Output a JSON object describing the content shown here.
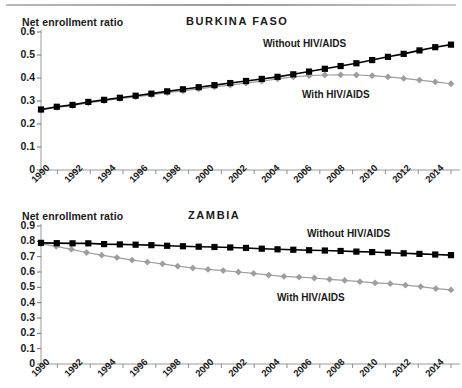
{
  "figure": {
    "y_axis_title": "Net enrollment ratio",
    "series_label_without": "Without HIV/AIDS",
    "series_label_with": "With HIV/AIDS",
    "color_without": "#000000",
    "color_with": "#9e9e9e"
  },
  "chart_data": [
    {
      "type": "line",
      "title": "BURKINA FASO",
      "xlabel": "",
      "ylabel": "Net enrollment ratio",
      "ylim": [
        0,
        0.6
      ],
      "yticks": [
        "0",
        "0.1",
        "0.2",
        "0.3",
        "0.4",
        "0.5",
        "0.6"
      ],
      "xlim": [
        1990,
        2015
      ],
      "xticks": [
        "1990",
        "1992",
        "1994",
        "1996",
        "1998",
        "2000",
        "2002",
        "2004",
        "2006",
        "2008",
        "2010",
        "2012",
        "2014"
      ],
      "grid": false,
      "legend": "inline-annotation",
      "x": [
        1990,
        1991,
        1992,
        1993,
        1994,
        1995,
        1996,
        1997,
        1998,
        1999,
        2000,
        2001,
        2002,
        2003,
        2004,
        2005,
        2006,
        2007,
        2008,
        2009,
        2010,
        2011,
        2012,
        2013,
        2014,
        2015
      ],
      "series": [
        {
          "name": "Without HIV/AIDS",
          "marker": "square",
          "color": "#000000",
          "values": [
            0.263,
            0.275,
            0.283,
            0.296,
            0.305,
            0.314,
            0.323,
            0.332,
            0.342,
            0.351,
            0.36,
            0.369,
            0.378,
            0.387,
            0.396,
            0.405,
            0.416,
            0.428,
            0.44,
            0.452,
            0.464,
            0.478,
            0.492,
            0.505,
            0.52,
            0.534,
            0.545
          ]
        },
        {
          "name": "With HIV/AIDS",
          "marker": "diamond",
          "color": "#9e9e9e",
          "values": [
            0.26,
            0.272,
            0.28,
            0.292,
            0.301,
            0.31,
            0.318,
            0.327,
            0.336,
            0.344,
            0.353,
            0.361,
            0.369,
            0.378,
            0.386,
            0.396,
            0.405,
            0.41,
            0.413,
            0.414,
            0.413,
            0.41,
            0.405,
            0.398,
            0.391,
            0.383,
            0.375
          ]
        }
      ]
    },
    {
      "type": "line",
      "title": "ZAMBIA",
      "xlabel": "",
      "ylabel": "Net enrollment ratio",
      "ylim": [
        0,
        0.9
      ],
      "yticks": [
        "0",
        "0.1",
        "0.2",
        "0.3",
        "0.4",
        "0.5",
        "0.6",
        "0.7",
        "0.8",
        "0.9"
      ],
      "xlim": [
        1990,
        2015
      ],
      "xticks": [
        "1990",
        "1992",
        "1994",
        "1996",
        "1998",
        "2000",
        "2002",
        "2004",
        "2006",
        "2008",
        "2010",
        "2012",
        "2014"
      ],
      "grid": false,
      "legend": "inline-annotation",
      "x": [
        1990,
        1991,
        1992,
        1993,
        1994,
        1995,
        1996,
        1997,
        1998,
        1999,
        2000,
        2001,
        2002,
        2003,
        2004,
        2005,
        2006,
        2007,
        2008,
        2009,
        2010,
        2011,
        2012,
        2013,
        2014,
        2015
      ],
      "series": [
        {
          "name": "Without HIV/AIDS",
          "marker": "square",
          "color": "#000000",
          "values": [
            0.79,
            0.788,
            0.787,
            0.787,
            0.782,
            0.78,
            0.778,
            0.775,
            0.771,
            0.768,
            0.765,
            0.763,
            0.76,
            0.757,
            0.752,
            0.748,
            0.745,
            0.742,
            0.74,
            0.737,
            0.733,
            0.73,
            0.726,
            0.722,
            0.718,
            0.714,
            0.71
          ]
        },
        {
          "name": "With HIV/AIDS",
          "marker": "diamond",
          "color": "#9e9e9e",
          "values": [
            0.785,
            0.767,
            0.748,
            0.727,
            0.71,
            0.694,
            0.678,
            0.665,
            0.653,
            0.638,
            0.626,
            0.617,
            0.609,
            0.6,
            0.591,
            0.58,
            0.571,
            0.566,
            0.561,
            0.552,
            0.545,
            0.537,
            0.529,
            0.524,
            0.514,
            0.505,
            0.492,
            0.483
          ]
        }
      ]
    }
  ]
}
